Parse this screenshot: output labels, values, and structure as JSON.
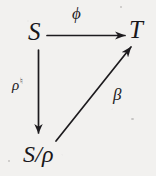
{
  "diagram": {
    "kind": "commutative-triangle",
    "background_color": "#f2f1ef",
    "ink_color": "#19171a",
    "nodes": [
      {
        "id": "S",
        "label": "S",
        "position": "top-left"
      },
      {
        "id": "T",
        "label": "T",
        "position": "top-right"
      },
      {
        "id": "Srho",
        "label": "S/ρ",
        "position": "bottom-left"
      }
    ],
    "arrows": [
      {
        "id": "phi",
        "from": "S",
        "to": "T",
        "label": "ϕ",
        "direction": "horizontal-right",
        "label_position": "above"
      },
      {
        "id": "rho-natural",
        "from": "S",
        "to": "Srho",
        "label": "ρ",
        "label_superscript": "♮",
        "direction": "vertical-down",
        "label_position": "left"
      },
      {
        "id": "beta",
        "from": "Srho",
        "to": "T",
        "label": "β",
        "direction": "diagonal-up-right",
        "label_position": "right"
      }
    ]
  }
}
